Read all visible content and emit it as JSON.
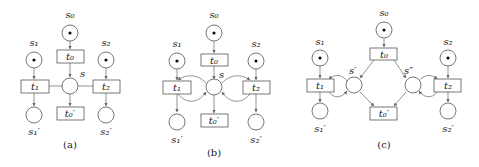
{
  "figure": {
    "panels": [
      {
        "caption": "(a)",
        "places": {
          "s0": "s₀",
          "s1": "s₁",
          "s2": "s₂",
          "s": "s",
          "s1p": "s₁′",
          "s2p": "s₂′"
        },
        "transitions": {
          "t0": "t₀",
          "t1": "t₁",
          "t2": "t₂",
          "t0p": "t₀′"
        },
        "marked_places": [
          "s0",
          "s1",
          "s2"
        ]
      },
      {
        "caption": "(b)",
        "places": {
          "s0": "s₀",
          "s1": "s₁",
          "s2": "s₂",
          "s": "s",
          "s1p": "s₁′",
          "s2p": "s₂′"
        },
        "transitions": {
          "t0": "t₀",
          "t1": "t₁",
          "t2": "t₂",
          "t0p": "t₀′"
        },
        "marked_places": [
          "s0",
          "s1",
          "s2"
        ]
      },
      {
        "caption": "(c)",
        "places": {
          "s0": "s₀",
          "s1": "s₁",
          "s2": "s₂",
          "sp": "s′",
          "spp": "s″",
          "s1p": "s₁′",
          "s2p": "s₂′"
        },
        "transitions": {
          "t0": "t₀",
          "t1": "t₁",
          "t2": "t₂",
          "t0p": "t₀′"
        },
        "marked_places": [
          "s0",
          "s1",
          "s2"
        ]
      }
    ],
    "colors": {
      "stroke": "#555555",
      "token": "#111111",
      "background": "#ffffff"
    }
  }
}
